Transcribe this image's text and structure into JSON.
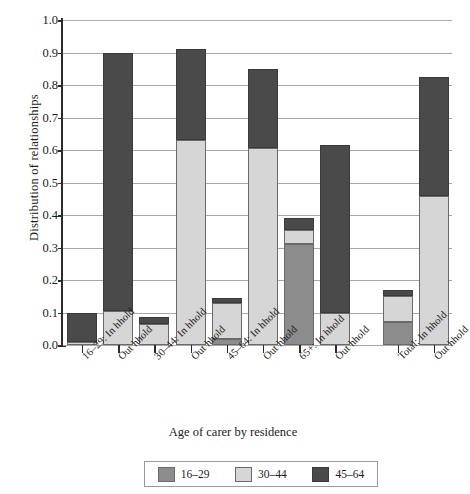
{
  "chart_data": {
    "type": "bar",
    "title": "",
    "xlabel": "Age of carer by residence",
    "ylabel": "Distribution of relationships",
    "ylim": [
      0.0,
      1.0
    ],
    "ytick_labels": [
      "0.0",
      "0.1",
      "0.2",
      "0.3",
      "0.4",
      "0.5",
      "0.6",
      "0.7",
      "0.8",
      "0.9",
      "1.0"
    ],
    "ytick_values": [
      0.0,
      0.1,
      0.2,
      0.3,
      0.4,
      0.5,
      0.6,
      0.7,
      0.8,
      0.9,
      1.0
    ],
    "grid": true,
    "stacked": true,
    "legend_position": "bottom",
    "categories": [
      "16–29: In hhold",
      "Out hhold",
      "30–44: In hhold",
      "Out hhold",
      "45–64: In hhold",
      "Out hhold",
      "65+: In hhold",
      "Out hhold",
      "Total: In hhold",
      "Out hhold"
    ],
    "series": [
      {
        "name": "16–29",
        "color": "#8c8c8c",
        "values": [
          0.0,
          0.0,
          0.0,
          0.0,
          0.02,
          0.0,
          0.31,
          0.0,
          0.07,
          0.0
        ]
      },
      {
        "name": "30–44",
        "color": "#d6d6d6",
        "values": [
          0.01,
          0.105,
          0.065,
          0.63,
          0.11,
          0.605,
          0.045,
          0.1,
          0.08,
          0.46
        ]
      },
      {
        "name": "45–64",
        "color": "#4a4a4a",
        "values": [
          0.09,
          0.795,
          0.02,
          0.28,
          0.015,
          0.245,
          0.035,
          0.515,
          0.02,
          0.365
        ]
      }
    ],
    "totals": [
      0.1,
      0.9,
      0.085,
      0.91,
      0.145,
      0.85,
      0.39,
      0.615,
      0.17,
      0.825
    ],
    "annotations": []
  },
  "legend": {
    "items": [
      {
        "label": "16–29",
        "color": "#8c8c8c"
      },
      {
        "label": "30–44",
        "color": "#d6d6d6"
      },
      {
        "label": "45–64",
        "color": "#4a4a4a"
      }
    ]
  }
}
